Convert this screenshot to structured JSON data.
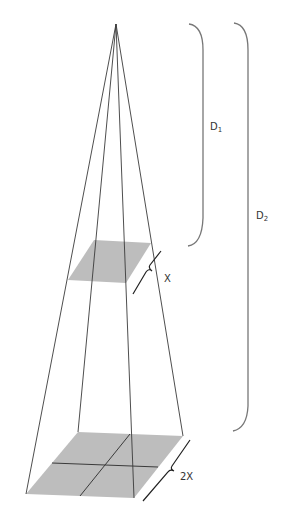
{
  "diagram": {
    "type": "inverse-square-law-pyramid",
    "labels": {
      "d1": "D",
      "d1_sub": "1",
      "d2": "D",
      "d2_sub": "2",
      "x": "X",
      "two_x": "2X"
    },
    "colors": {
      "line": "#3a3a3a",
      "square_fill": "#bdbdbd",
      "brace": "#777777"
    }
  }
}
